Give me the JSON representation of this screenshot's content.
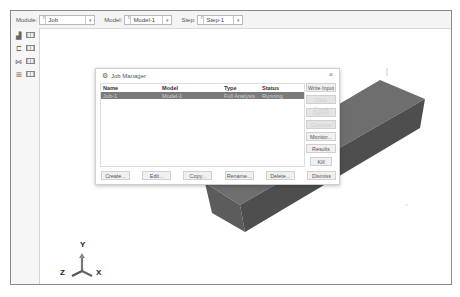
{
  "toolbar": {
    "module_label": "Module:",
    "module_value": "Job",
    "model_label": "Model:",
    "model_value": "Model-1",
    "step_label": "Step:",
    "step_value": "Step-1"
  },
  "left_toolbox": {
    "tools": [
      {
        "icon": "job-submit-icon"
      },
      {
        "icon": "job-manager-icon"
      },
      {
        "icon": "adaptivity-icon"
      },
      {
        "icon": "coupling-icon"
      }
    ]
  },
  "job_manager": {
    "title": "Job Manager",
    "close": "×",
    "columns": [
      "Name",
      "Model",
      "Type",
      "Status"
    ],
    "rows": [
      {
        "name": "Job-1",
        "model": "Model-1",
        "type": "Full Analysis",
        "status": "Running"
      }
    ],
    "side_buttons": [
      {
        "label": "Write Input",
        "enabled": true
      },
      {
        "label": "Data Check",
        "enabled": false
      },
      {
        "label": "Submit",
        "enabled": false
      },
      {
        "label": "Continue",
        "enabled": false
      },
      {
        "label": "Monitor...",
        "enabled": true
      },
      {
        "label": "Results",
        "enabled": true
      },
      {
        "label": "Kill",
        "enabled": true
      }
    ],
    "bottom_buttons": [
      "Create...",
      "Edit...",
      "Copy...",
      "Rename...",
      "Delete...",
      "Dismiss"
    ]
  },
  "triad": {
    "y": "Y",
    "z": "Z",
    "x": "X"
  },
  "colors": {
    "selected_row": "#7a7a7a",
    "part_top": "#6e6e6e",
    "part_front": "#5a5a5a",
    "part_side": "#4c4c4c"
  }
}
